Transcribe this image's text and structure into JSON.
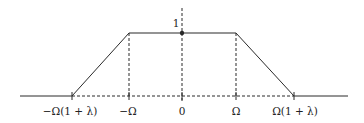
{
  "diagram": {
    "type": "trapezoidal-frequency-response",
    "peak_label": "1",
    "x_ticks": [
      {
        "label": "−Ω(1 + λ)",
        "x": 72
      },
      {
        "label": "−Ω",
        "x": 129
      },
      {
        "label": "0",
        "x": 182
      },
      {
        "label": "Ω",
        "x": 236
      },
      {
        "label": "Ω(1 + λ)",
        "x": 294
      }
    ],
    "colors": {
      "line": "#2a2a2a",
      "background": "#ffffff"
    }
  }
}
